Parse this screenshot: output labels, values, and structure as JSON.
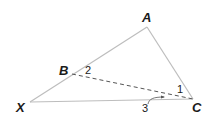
{
  "diagram": {
    "type": "triangle",
    "colors": {
      "side": "#bdbdbd",
      "dashed": "#555555",
      "label": "#1a1a1a"
    },
    "vertices": {
      "A": {
        "label": "A",
        "x": 147,
        "y": 27
      },
      "X": {
        "label": "X",
        "x": 30,
        "y": 102
      },
      "C": {
        "label": "C",
        "x": 193,
        "y": 99
      },
      "B": {
        "label": "B",
        "x": 72,
        "y": 74
      }
    },
    "segments": [
      {
        "from": "X",
        "to": "A",
        "style": "solid"
      },
      {
        "from": "A",
        "to": "C",
        "style": "solid"
      },
      {
        "from": "X",
        "to": "C",
        "style": "solid"
      },
      {
        "from": "B",
        "to": "C",
        "style": "dashed"
      }
    ],
    "angle_labels": {
      "angle1": "1",
      "angle2": "2",
      "angle3": "3"
    }
  }
}
